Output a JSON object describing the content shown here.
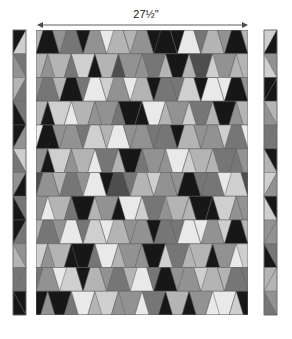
{
  "figure": {
    "kind": "quilt-pattern-diagram",
    "background_color": "#ffffff"
  },
  "dimension": {
    "label": "27½\"",
    "value_inches": 27.5,
    "orientation": "horizontal",
    "arrow_style": "double-headed",
    "arrow_color": "#4a4a4a",
    "x_start": 37,
    "x_end": 248,
    "y": 25
  },
  "palette": {
    "black": "#171717",
    "dark_gray": "#4e4e4e",
    "mid_gray": "#767676",
    "gray": "#929292",
    "light_gray": "#b4b4b4",
    "pale_gray": "#cfcfcf",
    "white_gray": "#e9e9e9",
    "outline": "#5f5f5f"
  },
  "main_panel": {
    "name": "quilt-body",
    "x": 36,
    "y": 30,
    "width": 212,
    "height": 285,
    "columns": 9,
    "rows": 12,
    "block_shape": "tumbler-trapezoid",
    "row_orientation_alternates": true,
    "grid": [
      [
        "black",
        "mid_gray",
        "gray",
        "light_gray",
        "gray",
        "black",
        "white_gray",
        "light_gray",
        "black"
      ],
      [
        "light_gray",
        "pale_gray",
        "light_gray",
        "gray",
        "mid_gray",
        "black",
        "dark_gray",
        "gray",
        "light_gray"
      ],
      [
        "mid_gray",
        "black",
        "white_gray",
        "gray",
        "light_gray",
        "mid_gray",
        "pale_gray",
        "white_gray",
        "black"
      ],
      [
        "pale_gray",
        "light_gray",
        "gray",
        "black",
        "white_gray",
        "gray",
        "mid_gray",
        "black",
        "light_gray"
      ],
      [
        "black",
        "gray",
        "pale_gray",
        "white_gray",
        "gray",
        "mid_gray",
        "light_gray",
        "gray",
        "mid_gray"
      ],
      [
        "pale_gray",
        "light_gray",
        "mid_gray",
        "black",
        "gray",
        "white_gray",
        "light_gray",
        "mid_gray",
        "gray"
      ],
      [
        "gray",
        "mid_gray",
        "white_gray",
        "dark_gray",
        "light_gray",
        "gray",
        "black",
        "mid_gray",
        "pale_gray"
      ],
      [
        "light_gray",
        "black",
        "gray",
        "white_gray",
        "mid_gray",
        "light_gray",
        "black",
        "pale_gray",
        "gray"
      ],
      [
        "mid_gray",
        "white_gray",
        "pale_gray",
        "light_gray",
        "gray",
        "mid_gray",
        "white_gray",
        "gray",
        "black"
      ],
      [
        "light_gray",
        "black",
        "white_gray",
        "gray",
        "black",
        "mid_gray",
        "light_gray",
        "gray",
        "pale_gray"
      ],
      [
        "gray",
        "pale_gray",
        "light_gray",
        "mid_gray",
        "white_gray",
        "black",
        "gray",
        "light_gray",
        "mid_gray"
      ],
      [
        "black",
        "white_gray",
        "pale_gray",
        "gray",
        "mid_gray",
        "light_gray",
        "gray",
        "white_gray",
        "black"
      ]
    ]
  },
  "left_border": {
    "name": "left-border-strip",
    "x": 13,
    "y": 30,
    "width": 13,
    "height": 285,
    "shape": "zigzag-triangles",
    "count": 12,
    "colors": [
      "black",
      "mid_gray",
      "light_gray",
      "mid_gray",
      "black",
      "pale_gray",
      "gray",
      "mid_gray",
      "black",
      "gray",
      "mid_gray",
      "black"
    ]
  },
  "right_border": {
    "name": "right-border-strip",
    "x": 264,
    "y": 30,
    "width": 13,
    "height": 285,
    "shape": "zigzag-triangles",
    "count": 12,
    "colors": [
      "pale_gray",
      "gray",
      "black",
      "light_gray",
      "mid_gray",
      "black",
      "pale_gray",
      "black",
      "gray",
      "mid_gray",
      "light_gray",
      "gray"
    ]
  }
}
